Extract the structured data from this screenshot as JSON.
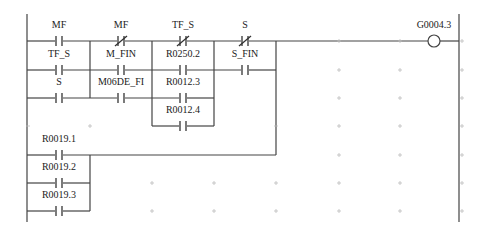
{
  "diagram": {
    "type": "ladder",
    "coil": {
      "label": "G0004.3",
      "x": 434,
      "y": 41
    },
    "contacts": [
      {
        "label": "MF",
        "type": "NO",
        "x": 59,
        "y": 41
      },
      {
        "label": "MF",
        "type": "NC",
        "x": 121,
        "y": 41
      },
      {
        "label": "TF_S",
        "type": "NC",
        "x": 183,
        "y": 41
      },
      {
        "label": "S",
        "type": "NC",
        "x": 245,
        "y": 41
      },
      {
        "label": "TF_S",
        "type": "NO",
        "x": 59,
        "y": 70
      },
      {
        "label": "M_FIN",
        "type": "NO",
        "x": 121,
        "y": 70
      },
      {
        "label": "R0250.2",
        "type": "NO",
        "x": 183,
        "y": 70
      },
      {
        "label": "S_FIN",
        "type": "NO",
        "x": 245,
        "y": 70
      },
      {
        "label": "S",
        "type": "NO",
        "x": 59,
        "y": 98
      },
      {
        "label": "M06DE_FI",
        "type": "NO",
        "x": 121,
        "y": 98
      },
      {
        "label": "R0012.3",
        "type": "NO",
        "x": 183,
        "y": 98
      },
      {
        "label": "R0012.4",
        "type": "NO",
        "x": 183,
        "y": 126
      },
      {
        "label": "R0019.1",
        "type": "NO",
        "x": 59,
        "y": 155
      },
      {
        "label": "R0019.2",
        "type": "NO",
        "x": 59,
        "y": 183
      },
      {
        "label": "R0019.3",
        "type": "NO",
        "x": 59,
        "y": 211
      }
    ]
  }
}
